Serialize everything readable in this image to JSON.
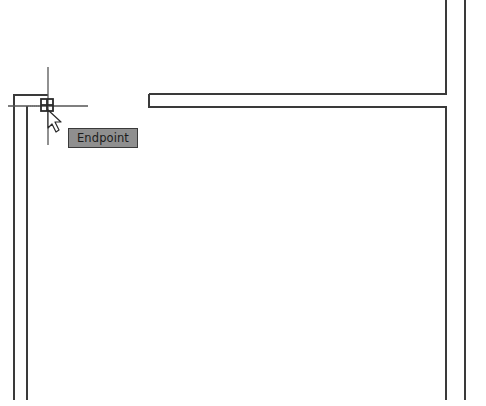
{
  "drawing": {
    "background_color": "#ffffff",
    "line_color": "#3a3a3a",
    "walls": [
      {
        "id": "left-wall-outer",
        "points": [
          [
            14,
            400
          ],
          [
            14,
            95
          ],
          [
            48,
            95
          ]
        ]
      },
      {
        "id": "left-wall-inner",
        "points": [
          [
            27,
            400
          ],
          [
            27,
            106
          ]
        ]
      },
      {
        "id": "horizontal-wall-top",
        "points": [
          [
            149,
            94
          ],
          [
            446,
            94
          ],
          [
            446,
            0
          ]
        ]
      },
      {
        "id": "horizontal-wall-bottom",
        "points": [
          [
            446,
            400
          ],
          [
            446,
            107
          ],
          [
            149,
            107
          ],
          [
            149,
            94
          ]
        ]
      },
      {
        "id": "right-wall-outer",
        "points": [
          [
            465,
            0
          ],
          [
            465,
            400
          ]
        ]
      }
    ]
  },
  "cursor": {
    "crosshair_center": [
      48,
      106
    ],
    "crosshair_color": "#555555",
    "snap_marker": "endpoint-snap-icon",
    "pointer": "arrow-cursor-icon"
  },
  "tooltip": {
    "label": "Endpoint",
    "background_color": "#8f8f8f"
  }
}
